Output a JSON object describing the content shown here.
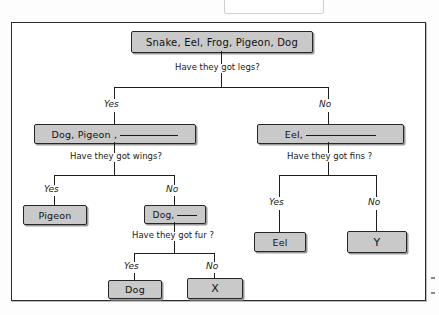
{
  "document": {
    "type": "hand-drawn dichotomous classification key",
    "title_fragment": ""
  },
  "tree": {
    "root": {
      "id": "root-node",
      "label": "Snake, Eel, Frog, Pigeon, Dog",
      "question": "Have they got legs?"
    },
    "level1": {
      "yes_label": "Yes",
      "no_label": "No",
      "left": {
        "id": "legs-yes-node",
        "label": "Dog, Pigeon ,",
        "has_blank": true,
        "question": "Have they got wings?"
      },
      "right": {
        "id": "legs-no-node",
        "label": "Eel,",
        "has_blank": true,
        "question": "Have they got fins ?"
      }
    },
    "level2_left": {
      "yes_label": "Yes",
      "no_label": "No",
      "left": {
        "id": "wings-yes-node",
        "label": "Pigeon",
        "has_blank": false
      },
      "right": {
        "id": "wings-no-node",
        "label": "Dog,",
        "has_blank": true,
        "question": "Have they got fur ?"
      }
    },
    "level2_right": {
      "yes_label": "Yes",
      "no_label": "No",
      "left": {
        "id": "fins-yes-node",
        "label": "Eel",
        "has_blank": false
      },
      "right": {
        "id": "fins-no-node",
        "label": "Y",
        "has_blank": false
      }
    },
    "level3": {
      "yes_label": "Yes",
      "no_label": "No",
      "left": {
        "id": "fur-yes-node",
        "label": "Dog",
        "has_blank": false
      },
      "right": {
        "id": "fur-no-node",
        "label": "X",
        "has_blank": false
      }
    }
  },
  "colors": {
    "node_fill": "#c9c9c9",
    "ink": "#1a1a1a",
    "frame": "#2b2b2b",
    "page": "#fdfdfd"
  }
}
